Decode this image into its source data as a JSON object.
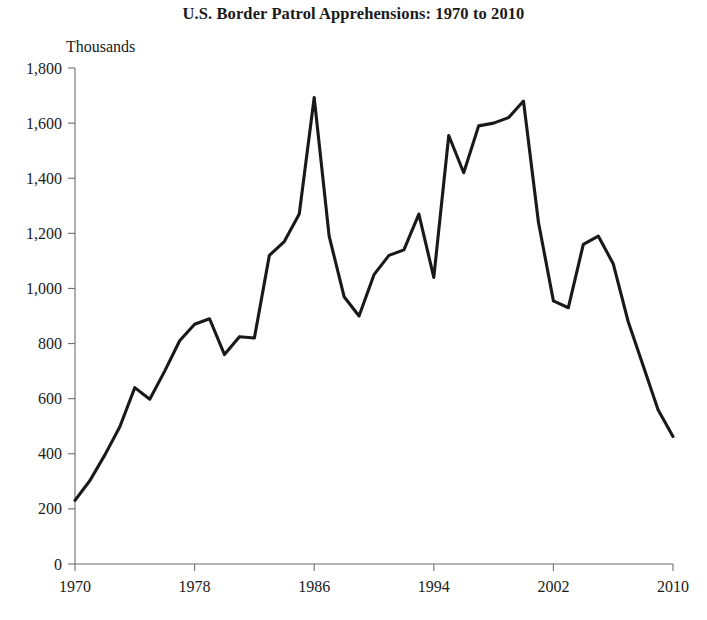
{
  "chart_data": {
    "type": "line",
    "title": "U.S. Border Patrol Apprehensions: 1970 to 2010",
    "ylabel": "Thousands",
    "xlabel": "",
    "grid": false,
    "legend": null,
    "legend_position": "none",
    "xlim": [
      1970,
      2010
    ],
    "ylim": [
      0,
      1800
    ],
    "ytick_labels": [
      "1,800",
      "1,600",
      "1,400",
      "1,200",
      "1,000",
      "800",
      "600",
      "400",
      "200",
      "0"
    ],
    "ytick_values": [
      1800,
      1600,
      1400,
      1200,
      1000,
      800,
      600,
      400,
      200,
      0
    ],
    "xtick_labels": [
      "1970",
      "1978",
      "1986",
      "1994",
      "2002",
      "2010"
    ],
    "xtick_values": [
      1970,
      1978,
      1986,
      1994,
      2002,
      2010
    ],
    "series": [
      {
        "name": "Apprehensions",
        "color": "#191919",
        "x": [
          1970,
          1971,
          1972,
          1973,
          1974,
          1975,
          1976,
          1977,
          1978,
          1979,
          1980,
          1981,
          1982,
          1983,
          1984,
          1985,
          1986,
          1987,
          1988,
          1989,
          1990,
          1991,
          1992,
          1993,
          1994,
          1995,
          1996,
          1997,
          1998,
          1999,
          2000,
          2001,
          2002,
          2003,
          2004,
          2005,
          2006,
          2007,
          2008,
          2009,
          2010
        ],
        "values": [
          231,
          303,
          396,
          498,
          640,
          598,
          700,
          810,
          870,
          890,
          760,
          825,
          820,
          1120,
          1170,
          1270,
          1693,
          1190,
          970,
          900,
          1050,
          1120,
          1140,
          1270,
          1040,
          1555,
          1420,
          1590,
          1600,
          1620,
          1680,
          1240,
          955,
          930,
          1160,
          1190,
          1090,
          880,
          720,
          560,
          463
        ]
      }
    ]
  }
}
